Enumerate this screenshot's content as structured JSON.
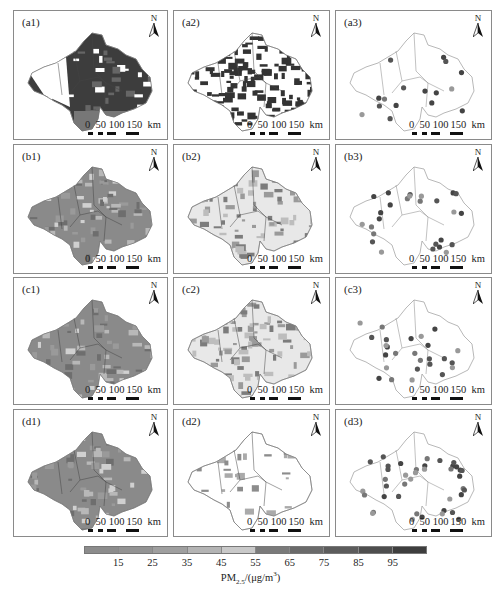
{
  "panels": [
    {
      "label": "(a1)",
      "style": "dense-dark",
      "row": 0,
      "col": 0
    },
    {
      "label": "(a2)",
      "style": "patchy-dark",
      "row": 0,
      "col": 1
    },
    {
      "label": "(a3)",
      "style": "points",
      "row": 0,
      "col": 2
    },
    {
      "label": "(b1)",
      "style": "medium-fill",
      "row": 1,
      "col": 0
    },
    {
      "label": "(b2)",
      "style": "light-patchy",
      "row": 1,
      "col": 1
    },
    {
      "label": "(b3)",
      "style": "points",
      "row": 1,
      "col": 2
    },
    {
      "label": "(c1)",
      "style": "medium-fill",
      "row": 2,
      "col": 0
    },
    {
      "label": "(c2)",
      "style": "light-patchy",
      "row": 2,
      "col": 1
    },
    {
      "label": "(c3)",
      "style": "points",
      "row": 2,
      "col": 2
    },
    {
      "label": "(d1)",
      "style": "medium-fill",
      "row": 3,
      "col": 0
    },
    {
      "label": "(d2)",
      "style": "sparse",
      "row": 3,
      "col": 1
    },
    {
      "label": "(d3)",
      "style": "points",
      "row": 3,
      "col": 2
    }
  ],
  "north_arrow": {
    "label": "N"
  },
  "scale_bar": {
    "text": "0   50 100 150  km",
    "ticks": [
      "0",
      "50",
      "100",
      "150"
    ],
    "unit": "km"
  },
  "colorbar": {
    "title": "PM2.5/(μg/m³)",
    "ticks": [
      "15",
      "25",
      "35",
      "45",
      "55",
      "65",
      "75",
      "85",
      "95"
    ],
    "colors": [
      "#8c8c8c",
      "#939393",
      "#9f9f9f",
      "#b4b4b4",
      "#c9c9c9",
      "#7a7a7a",
      "#6a6a6a",
      "#5c5c5c",
      "#4e4e4e",
      "#3e3e3e"
    ]
  },
  "chart_data": {
    "type": "heatmap",
    "panels": [
      "(a1)",
      "(a2)",
      "(a3)",
      "(b1)",
      "(b2)",
      "(b3)",
      "(c1)",
      "(c2)",
      "(c3)",
      "(d1)",
      "(d2)",
      "(d3)"
    ],
    "legend": {
      "label": "PM2.5/(μg/m³)",
      "ticks": [
        15,
        25,
        35,
        45,
        55,
        65,
        75,
        85,
        95
      ],
      "n_classes": 10
    },
    "scale_bar_km": [
      0,
      50,
      100,
      150
    ],
    "north_arrow": true
  }
}
